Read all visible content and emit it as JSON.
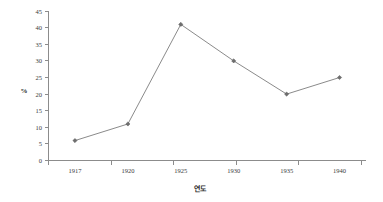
{
  "chart_data": {
    "type": "line",
    "title": "",
    "subtitle": "",
    "xlabel": "연도",
    "ylabel": "%",
    "categories": [
      "1917",
      "1920",
      "1925",
      "1930",
      "1935",
      "1940"
    ],
    "values": [
      6,
      11,
      41,
      30,
      20,
      25
    ],
    "series": [
      {
        "name": "",
        "values": [
          6,
          11,
          41,
          30,
          20,
          25
        ]
      }
    ],
    "ylim": [
      0,
      45
    ],
    "y_ticks": [
      "0",
      "5",
      "10",
      "15",
      "20",
      "25",
      "30",
      "35",
      "40",
      "45"
    ],
    "y_tick_values": [
      0,
      5,
      10,
      15,
      20,
      25,
      30,
      35,
      40,
      45
    ],
    "x_ticks": [
      "1917",
      "1920",
      "1925",
      "1930",
      "1935",
      "1940"
    ],
    "grid": false,
    "legend": false,
    "legend_position": "none",
    "marker": "diamond",
    "colors": {
      "line": "#7d7d7d",
      "marker": "#6e6e6e",
      "axis": "#8c8c8c",
      "text": "#3a3a3a",
      "background": "#ffffff"
    }
  }
}
